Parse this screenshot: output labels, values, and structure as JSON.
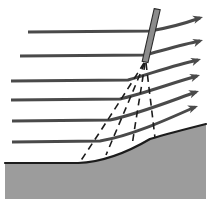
{
  "figure": {
    "type": "flow-schematic",
    "canvas": {
      "width": 211,
      "height": 204,
      "background": "#ffffff"
    },
    "margins": {
      "left": 5,
      "right": 5,
      "top": 5,
      "bottom": 5
    }
  },
  "colors": {
    "streamline": "#4a4a4a",
    "shock_fill": "#8c8c8c",
    "shock_stroke": "#2b2b2b",
    "mach_wave": "#1c1c1c",
    "ground_fill": "#9c9c9c",
    "ground_stroke": "#1c1c1c",
    "background": "#ffffff"
  },
  "geometry": {
    "focal_point": {
      "x": 145,
      "y": 62
    },
    "surface_flat_y": 163,
    "surface_curve_start_x": 78,
    "surface_right_y": 124
  },
  "ground": {
    "label": "concave-curved solid surface",
    "fill": "#9c9c9c",
    "path": "M 5,163 L 78,163 C 104,162 128,152 150,139 C 170,133 190,128 206,124 L 206,199 L 5,199 Z",
    "outline": "M 5,163 L 78,163 C 104,162 128,152 150,139 C 170,133 190,128 206,124"
  },
  "shock": {
    "name": "oblique-shock-wave",
    "label": "oblique shock wave",
    "fill": "#8c8c8c",
    "stroke": "#2b2b2b",
    "stroke_width": 1.1,
    "top": {
      "x": 157,
      "y": 9
    },
    "bottom": {
      "x": 145,
      "y": 62
    },
    "thickness": 5.5,
    "polygon": "154.2,8.6 160.2,9.8 148.0,62.6 142.2,61.4"
  },
  "mach_waves": {
    "name": "compression-wave-fan",
    "label": "compression (Mach) waves",
    "stroke": "#1c1c1c",
    "stroke_width": 1.6,
    "dash": "7 5",
    "count": 4,
    "lines": [
      {
        "id": "mach-wave-1",
        "path": "M 144,63 C 126,92 104,126 80,162"
      },
      {
        "id": "mach-wave-2",
        "path": "M 144.5,63 C 133,92 119,124 106,155"
      },
      {
        "id": "mach-wave-3",
        "path": "M 145,63 C 141,91 136,118 132,146"
      },
      {
        "id": "mach-wave-4",
        "path": "M 146,63 C 149,88 152,112 155,138"
      }
    ]
  },
  "streamlines": {
    "name": "streamlines",
    "label": "streamlines (flow direction left to right)",
    "stroke": "#4a4a4a",
    "stroke_width": 3.0,
    "count": 6,
    "arrowhead": {
      "length": 10,
      "half_width": 4.2
    },
    "lines": [
      {
        "id": "streamline-1",
        "inlet_y": 32,
        "inlet_x": 28,
        "path": "M 28,32 L 150,31 C 168,28 186,23 200,18",
        "tip": {
          "x": 203,
          "y": 17
        },
        "angle_deg": -16
      },
      {
        "id": "streamline-2",
        "inlet_y": 56,
        "inlet_x": 20,
        "path": "M 20,56 L 145,55 C 164,50 184,44 200,41",
        "tip": {
          "x": 203,
          "y": 40
        },
        "angle_deg": -17
      },
      {
        "id": "streamline-3",
        "inlet_y": 81,
        "inlet_x": 11,
        "path": "M 11,81 L 128,80 C 150,74 174,65 198,60",
        "tip": {
          "x": 201,
          "y": 59
        },
        "angle_deg": -18
      },
      {
        "id": "streamline-4",
        "inlet_y": 100,
        "inlet_x": 11,
        "path": "M 11,100 L 120,99 C 145,93 172,83 197,76",
        "tip": {
          "x": 200,
          "y": 75
        },
        "angle_deg": -18
      },
      {
        "id": "streamline-5",
        "inlet_y": 121,
        "inlet_x": 12,
        "path": "M 12,121 L 110,120 C 138,114 168,102 196,92",
        "tip": {
          "x": 199,
          "y": 91
        },
        "angle_deg": -19
      },
      {
        "id": "streamline-6",
        "inlet_y": 142,
        "inlet_x": 12,
        "path": "M 12,142 L 100,141 C 130,136 164,121 195,107",
        "tip": {
          "x": 198,
          "y": 106
        },
        "angle_deg": -20
      }
    ]
  }
}
